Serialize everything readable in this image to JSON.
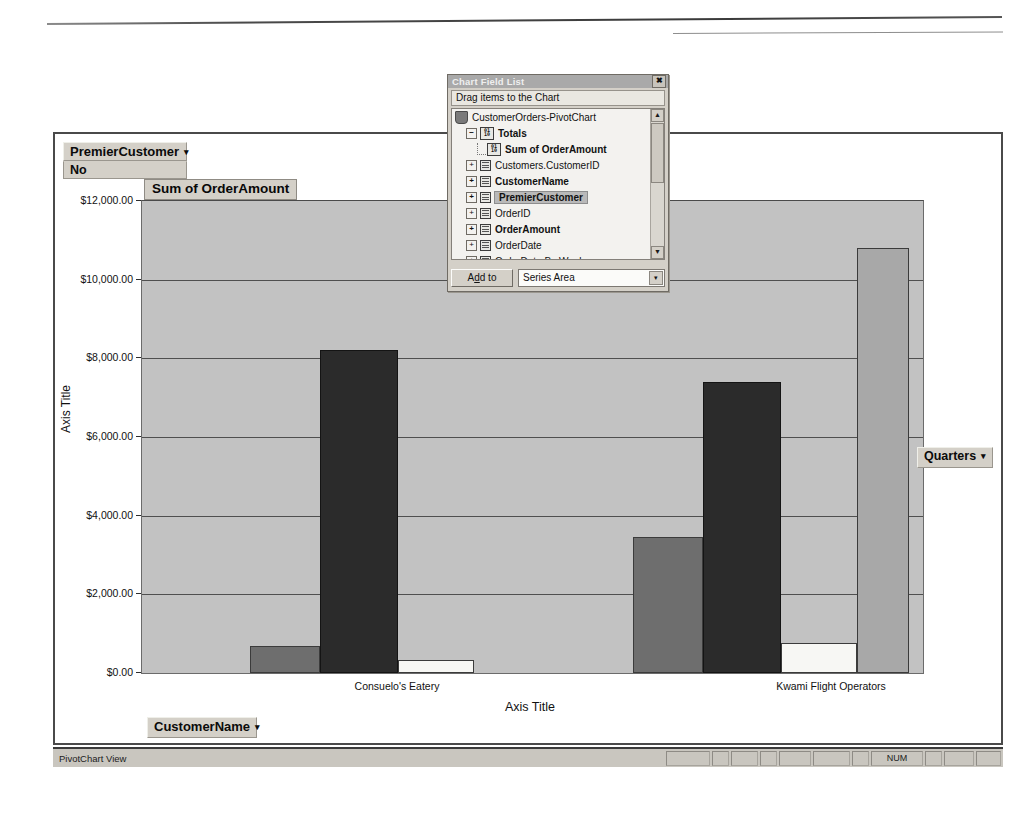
{
  "window": {
    "status_left": "PivotChart View",
    "status_num": "NUM"
  },
  "filter": {
    "field_label": "PremierCustomer",
    "field_value": "No",
    "caret": "▾"
  },
  "category_field": {
    "label": "CustomerName",
    "caret": "▾"
  },
  "series_field": {
    "label": "Quarters",
    "caret": "▾"
  },
  "chart_data": {
    "type": "bar",
    "title": "Sum of OrderAmount",
    "xlabel": "Axis Title",
    "ylabel": "Axis Title",
    "ylim": [
      0,
      12000
    ],
    "grid": true,
    "legend_position": "none",
    "ytick_labels": [
      "$12,000.00",
      "$10,000.00",
      "$8,000.00",
      "$6,000.00",
      "$4,000.00",
      "$2,000.00",
      "$0.00"
    ],
    "ytick_values": [
      12000,
      10000,
      8000,
      6000,
      4000,
      2000,
      0
    ],
    "categories": [
      "Consuelo's Eatery",
      "Kwami Flight Operators"
    ],
    "series": [
      {
        "name": "Qtr1",
        "color": "#6e6e6e",
        "values": [
          690,
          3450
        ]
      },
      {
        "name": "Qtr2",
        "color": "#2b2b2b",
        "values": [
          8200,
          7400
        ]
      },
      {
        "name": "Qtr3",
        "color": "#f7f7f4",
        "values": [
          330,
          760
        ]
      },
      {
        "name": "Qtr4",
        "color": "#a8a8a8",
        "values": [
          0,
          10800
        ]
      }
    ]
  },
  "field_list": {
    "title": "Chart Field List",
    "close_glyph": "✖",
    "prompt": "Drag items to the Chart",
    "add_to_label_pre": "A",
    "add_to_label_u": "d",
    "add_to_label_post": "d to",
    "add_to_full": "Add to",
    "drop_area": "Series Area",
    "scroll_up": "▲",
    "scroll_down": "▼",
    "combo_caret": "▾",
    "expand_glyph": "+",
    "collapse_glyph": "−",
    "items": [
      {
        "label": "CustomerOrders-PivotChart",
        "icon": "book-icon",
        "indent": 0,
        "bold": false,
        "selected": false,
        "expander": ""
      },
      {
        "label": "Totals",
        "icon": "numeric-icon",
        "indent": 1,
        "bold": true,
        "selected": false,
        "expander": "−"
      },
      {
        "label": "Sum of OrderAmount",
        "icon": "numeric-icon",
        "indent": 2,
        "bold": true,
        "selected": false,
        "expander": ""
      },
      {
        "label": "Customers.CustomerID",
        "icon": "field-icon",
        "indent": 1,
        "bold": false,
        "selected": false,
        "expander": "+"
      },
      {
        "label": "CustomerName",
        "icon": "field-icon",
        "indent": 1,
        "bold": true,
        "selected": false,
        "expander": "+"
      },
      {
        "label": "PremierCustomer",
        "icon": "field-icon",
        "indent": 1,
        "bold": true,
        "selected": true,
        "expander": "+"
      },
      {
        "label": "OrderID",
        "icon": "field-icon",
        "indent": 1,
        "bold": false,
        "selected": false,
        "expander": "+"
      },
      {
        "label": "OrderAmount",
        "icon": "field-icon",
        "indent": 1,
        "bold": true,
        "selected": false,
        "expander": "+"
      },
      {
        "label": "OrderDate",
        "icon": "field-icon",
        "indent": 1,
        "bold": false,
        "selected": false,
        "expander": "+"
      },
      {
        "label": "OrderDate By Week",
        "icon": "field-icon",
        "indent": 1,
        "bold": false,
        "selected": false,
        "expander": "+"
      }
    ]
  }
}
